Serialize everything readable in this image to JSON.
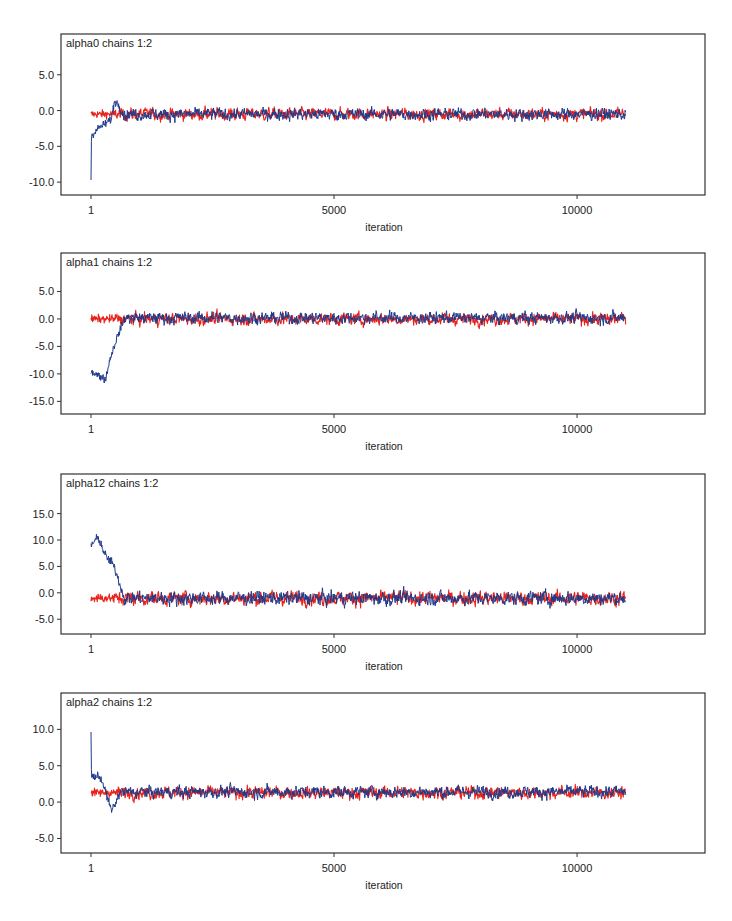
{
  "colors": {
    "chain1": "#e8231c",
    "chain2": "#1f3a8a",
    "frame": "#333333",
    "text": "#222222"
  },
  "x_axis": {
    "label": "iteration",
    "ticks": [
      1,
      5000,
      10000
    ],
    "tick_labels": [
      "1",
      "5000",
      "10000"
    ],
    "range": [
      1,
      11000
    ]
  },
  "chart_data": [
    {
      "type": "line",
      "title": "alpha0 chains 1:2",
      "xlabel": "iteration",
      "ylabel": "",
      "yticks": [
        5.0,
        0.0,
        -5.0,
        -10.0
      ],
      "ytick_labels": [
        "5.0",
        "0.0",
        "-5.0",
        "-10.0"
      ],
      "ylim": [
        -11.8,
        10.7
      ],
      "x": {
        "start": 1,
        "end": 11000
      },
      "series": [
        {
          "name": "chain 1",
          "color": "#e8231c",
          "mean": -0.5,
          "noise": 0.35,
          "burnin": [
            [
              1,
              -0.5
            ],
            [
              500,
              -0.5
            ]
          ]
        },
        {
          "name": "chain 2",
          "color": "#1f3a8a",
          "mean": -0.5,
          "noise": 0.35,
          "burnin": [
            [
              1,
              -9.5
            ],
            [
              10,
              -3.5
            ],
            [
              150,
              -2.5
            ],
            [
              300,
              -1.8
            ],
            [
              420,
              -1.2
            ],
            [
              480,
              1.2
            ],
            [
              560,
              1.0
            ],
            [
              650,
              -0.5
            ]
          ]
        }
      ]
    },
    {
      "type": "line",
      "title": "alpha1 chains 1:2",
      "xlabel": "iteration",
      "ylabel": "",
      "yticks": [
        5.0,
        0.0,
        -5.0,
        -10.0,
        -15.0
      ],
      "ytick_labels": [
        "5.0",
        "0.0",
        "-5.0",
        "-10.0",
        "-15.0"
      ],
      "ylim": [
        -17.3,
        12.0
      ],
      "x": {
        "start": 1,
        "end": 11000
      },
      "series": [
        {
          "name": "chain 1",
          "color": "#e8231c",
          "mean": 0.0,
          "noise": 0.45,
          "burnin": [
            [
              1,
              0.0
            ],
            [
              500,
              0.0
            ]
          ]
        },
        {
          "name": "chain 2",
          "color": "#1f3a8a",
          "mean": 0.2,
          "noise": 0.45,
          "burnin": [
            [
              1,
              -9.5
            ],
            [
              200,
              -10.5
            ],
            [
              300,
              -11.0
            ],
            [
              400,
              -7.0
            ],
            [
              550,
              -3.0
            ],
            [
              700,
              0.2
            ]
          ]
        }
      ]
    },
    {
      "type": "line",
      "title": "alpha12 chains 1:2",
      "xlabel": "iteration",
      "ylabel": "",
      "yticks": [
        15.0,
        10.0,
        5.0,
        0.0,
        -5.0
      ],
      "ytick_labels": [
        "15.0",
        "10.0",
        "5.0",
        "0.0",
        "-5.0"
      ],
      "ylim": [
        -7.8,
        22.5
      ],
      "x": {
        "start": 1,
        "end": 11000
      },
      "series": [
        {
          "name": "chain 1",
          "color": "#e8231c",
          "mean": -1.0,
          "noise": 0.55,
          "burnin": [
            [
              1,
              -1.0
            ],
            [
              500,
              -1.0
            ]
          ]
        },
        {
          "name": "chain 2",
          "color": "#1f3a8a",
          "mean": -1.0,
          "noise": 0.55,
          "burnin": [
            [
              1,
              9.0
            ],
            [
              150,
              10.5
            ],
            [
              300,
              7.0
            ],
            [
              450,
              5.5
            ],
            [
              550,
              3.0
            ],
            [
              680,
              -1.0
            ]
          ]
        }
      ]
    },
    {
      "type": "line",
      "title": "alpha2 chains 1:2",
      "xlabel": "iteration",
      "ylabel": "",
      "yticks": [
        10.0,
        5.0,
        0.0,
        -5.0
      ],
      "ytick_labels": [
        "10.0",
        "5.0",
        "0.0",
        "-5.0"
      ],
      "ylim": [
        -7.0,
        15.0
      ],
      "x": {
        "start": 1,
        "end": 11000
      },
      "series": [
        {
          "name": "chain 1",
          "color": "#e8231c",
          "mean": 1.3,
          "noise": 0.35,
          "burnin": [
            [
              1,
              1.3
            ],
            [
              500,
              1.3
            ]
          ]
        },
        {
          "name": "chain 2",
          "color": "#1f3a8a",
          "mean": 1.4,
          "noise": 0.35,
          "burnin": [
            [
              1,
              9.5
            ],
            [
              10,
              3.6
            ],
            [
              200,
              3.4
            ],
            [
              300,
              1.5
            ],
            [
              420,
              -1.2
            ],
            [
              520,
              0.0
            ],
            [
              600,
              1.4
            ]
          ]
        }
      ]
    }
  ]
}
